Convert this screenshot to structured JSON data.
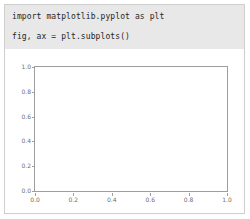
{
  "card": {
    "border_color": "#cfcfcf",
    "background": "#ffffff"
  },
  "code_block": {
    "background": "#e8e8e8",
    "text_color": "#262626",
    "lines": [
      "import matplotlib.pyplot as plt",
      "fig, ax = plt.subplots()"
    ]
  },
  "chart_data": {
    "type": "line",
    "title": "",
    "xlabel": "",
    "ylabel": "",
    "series": [
      {
        "name": "",
        "x": [],
        "y": []
      }
    ],
    "xlim": [
      0.0,
      1.0
    ],
    "ylim": [
      0.0,
      1.0
    ],
    "xticks": [
      0.0,
      0.2,
      0.4,
      0.6,
      0.8,
      1.0
    ],
    "yticks": [
      0.0,
      0.2,
      0.4,
      0.6,
      0.8,
      1.0
    ],
    "xticklabels": [
      "0.0",
      "0.2",
      "0.4",
      "0.6",
      "0.8",
      "1.0"
    ],
    "yticklabels": [
      "0.0",
      "0.2",
      "0.4",
      "0.6",
      "0.8",
      "1.0"
    ],
    "grid": false,
    "legend": null,
    "annotations": [],
    "spine_color": "#9e9e9e",
    "tick_label_color": "#6e6e6e",
    "plot_background": "#ffffff"
  }
}
